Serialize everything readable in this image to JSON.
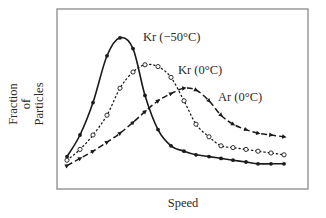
{
  "chart_data": {
    "type": "line",
    "title": "",
    "xlabel": "Speed",
    "ylabel": "Fraction of Particles",
    "ylabel_lines": [
      "Fraction",
      "of",
      "Particles"
    ],
    "xlim": [
      0,
      17
    ],
    "ylim": [
      0,
      1
    ],
    "grid": false,
    "legend": "inline labels",
    "x": [
      0,
      1,
      2,
      3,
      4,
      5,
      6,
      7,
      8,
      9,
      10,
      11,
      12,
      13,
      14,
      15,
      16,
      17
    ],
    "series": [
      {
        "name": "Kr (−50°C)",
        "style": "solid",
        "marker": "filled-circle",
        "color": "#1a1a1a",
        "values": [
          0.18,
          0.3,
          0.48,
          0.74,
          0.84,
          0.78,
          0.52,
          0.33,
          0.24,
          0.21,
          0.19,
          0.18,
          0.17,
          0.16,
          0.15,
          0.14,
          0.14,
          0.14
        ]
      },
      {
        "name": "Kr (0°C)",
        "style": "dotted",
        "marker": "open-circle",
        "color": "#1a1a1a",
        "values": [
          0.16,
          0.22,
          0.3,
          0.41,
          0.56,
          0.65,
          0.69,
          0.68,
          0.62,
          0.49,
          0.36,
          0.29,
          0.24,
          0.23,
          0.22,
          0.21,
          0.2,
          0.19
        ]
      },
      {
        "name": "Ar (0°C)",
        "style": "dashed",
        "marker": "triangle",
        "color": "#1a1a1a",
        "values": [
          0.13,
          0.17,
          0.21,
          0.26,
          0.31,
          0.37,
          0.43,
          0.49,
          0.53,
          0.56,
          0.55,
          0.49,
          0.41,
          0.36,
          0.33,
          0.31,
          0.3,
          0.29
        ]
      }
    ],
    "annotations": [
      {
        "text": "Kr (−50°C)",
        "series": 0
      },
      {
        "text": "Kr (0°C)",
        "series": 1
      },
      {
        "text": "Ar (0°C)",
        "series": 2
      }
    ]
  },
  "layout": {
    "frame": {
      "x0": 57,
      "y0": 9,
      "x1": 308,
      "y1": 189
    },
    "px_x": [
      67,
      80,
      93,
      107,
      120,
      133,
      145,
      158,
      171,
      184,
      196,
      209,
      221,
      233,
      246,
      258,
      271,
      284
    ],
    "label_pos": [
      {
        "x": 143,
        "y": 41
      },
      {
        "x": 178,
        "y": 74
      },
      {
        "x": 218,
        "y": 101
      }
    ]
  }
}
